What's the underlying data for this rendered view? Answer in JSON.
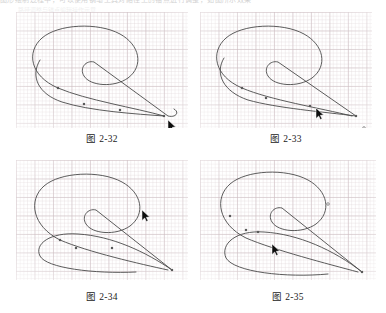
{
  "page": {
    "background_color": "#ffffff",
    "top_cut_text": "图形绘制过程中，可以使用钢笔工具对路径上的锚点进行调整，如图所示效果",
    "top_cut_text2": "路径调整与锚点编辑操作示意"
  },
  "figures": [
    {
      "id": "fig-2-32",
      "caption": "图 2-32",
      "panel": {
        "x": 16,
        "y": 12,
        "w": 172,
        "h": 116
      },
      "caption_box": {
        "x": 16,
        "y": 131,
        "w": 172
      },
      "grid_color": "#b0969e",
      "stroke_color": "#4a4a4a",
      "path": "M 148 104 C 120 96, 70 88, 42 76 C 14 64, 10 40, 26 26 C 42 12, 82 10, 104 22 C 124 33, 128 54, 112 66 C 98 76, 74 74, 68 64 C 63 56, 70 48, 78 50 L 152 104 C 160 106, 164 100, 158 97",
      "path2": "M 148 104 C 120 102, 74 99, 46 90 C 22 82, 14 64, 24 48",
      "anchors": [
        {
          "x": 148,
          "y": 104
        },
        {
          "x": 104,
          "y": 98
        },
        {
          "x": 68,
          "y": 92
        },
        {
          "x": 42,
          "y": 76
        }
      ],
      "cursor": {
        "x": 152,
        "y": 108
      },
      "handle_dot": {
        "x": 157,
        "y": 118
      }
    },
    {
      "id": "fig-2-33",
      "caption": "图 2-33",
      "panel": {
        "x": 200,
        "y": 12,
        "w": 172,
        "h": 116
      },
      "caption_box": {
        "x": 200,
        "y": 131,
        "w": 172
      },
      "grid_color": "#b0969e",
      "stroke_color": "#4a4a4a",
      "path": "M 152 104 C 120 96, 70 88, 42 76 C 14 64, 10 40, 26 26 C 42 12, 82 10, 104 22 C 124 33, 128 54, 112 66 C 98 76, 74 74, 68 64 C 63 56, 70 48, 78 50 L 156 104",
      "path2": "M 156 104 C 124 100, 76 96, 48 88 C 24 80, 14 62, 24 46",
      "anchors": [
        {
          "x": 156,
          "y": 104
        },
        {
          "x": 110,
          "y": 94
        },
        {
          "x": 66,
          "y": 86
        },
        {
          "x": 42,
          "y": 76
        }
      ],
      "cursor": {
        "x": 116,
        "y": 96
      },
      "handle_dot": {
        "x": 164,
        "y": 116
      }
    },
    {
      "id": "fig-2-34",
      "caption": "图 2-34",
      "panel": {
        "x": 16,
        "y": 160,
        "w": 172,
        "h": 120
      },
      "caption_box": {
        "x": 16,
        "y": 289,
        "w": 172
      },
      "grid_color": "#b0969e",
      "stroke_color": "#4a4a4a",
      "path": "M 152 110 C 124 104, 72 92, 44 80 C 16 66, 12 40, 28 26 C 44 12, 84 10, 106 22 C 126 33, 130 54, 114 66 C 100 76, 76 74, 70 64 C 65 56, 72 48, 80 50 L 156 110",
      "path2": "M 156 110 C 130 92, 96 76, 62 74 C 34 72, 18 84, 24 96 C 30 108, 78 114, 120 112",
      "anchors": [
        {
          "x": 156,
          "y": 110
        },
        {
          "x": 96,
          "y": 88
        },
        {
          "x": 60,
          "y": 88
        },
        {
          "x": 44,
          "y": 80
        }
      ],
      "cursor": {
        "x": 126,
        "y": 50
      },
      "handle_dot": {
        "x": 152,
        "y": 124
      }
    },
    {
      "id": "fig-2-35",
      "caption": "图 2-35",
      "panel": {
        "x": 200,
        "y": 160,
        "w": 176,
        "h": 120
      },
      "caption_box": {
        "x": 200,
        "y": 289,
        "w": 176
      },
      "grid_color": "#b0969e",
      "stroke_color": "#4a4a4a",
      "path": "M 158 112 C 128 104, 74 90, 46 78 C 18 64, 14 38, 30 24 C 46 10, 86 8, 108 20 C 128 31, 132 52, 116 64 C 102 74, 78 72, 72 62 C 67 54, 74 46, 82 48 L 162 112",
      "path2": "M 162 112 C 134 90, 98 74, 64 72 C 36 70, 20 84, 26 98 C 34 112, 86 118, 128 114",
      "anchors": [
        {
          "x": 162,
          "y": 112
        },
        {
          "x": 58,
          "y": 72
        },
        {
          "x": 46,
          "y": 70
        },
        {
          "x": 30,
          "y": 56
        }
      ],
      "cursor": {
        "x": 72,
        "y": 84
      },
      "handle_dot": {
        "x": 128,
        "y": 44
      }
    }
  ]
}
